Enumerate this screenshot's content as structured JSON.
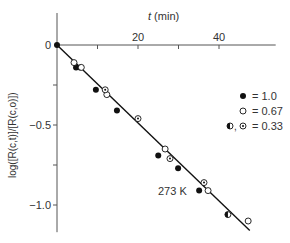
{
  "chart_data": {
    "type": "scatter",
    "title": "",
    "xlabel": "t (min)",
    "ylabel": "log([R(c,t)]/[R(c,o)])",
    "xlim": [
      0,
      54
    ],
    "ylim": [
      -1.17,
      0.2
    ],
    "x_ticks": [
      {
        "value": 0,
        "label": ""
      },
      {
        "value": 10,
        "label": ""
      },
      {
        "value": 20,
        "label": "20"
      },
      {
        "value": 30,
        "label": ""
      },
      {
        "value": 40,
        "label": "40"
      }
    ],
    "y_ticks": [
      {
        "value": 0,
        "label": "0"
      },
      {
        "value": -0.25,
        "label": ""
      },
      {
        "value": -0.5,
        "label": "-0.5"
      },
      {
        "value": -0.75,
        "label": ""
      },
      {
        "value": -1.0,
        "label": "-1.0"
      }
    ],
    "grid": false,
    "x_axis_position": "top",
    "legend_position": "right-middle",
    "annotation": "273 K",
    "fit_line": {
      "x": [
        0,
        47.6
      ],
      "y": [
        0,
        -1.16
      ]
    },
    "series": [
      {
        "name": "= 1.0",
        "marker": "filled",
        "points": [
          {
            "x": 0,
            "y": 0
          },
          {
            "x": 4.7,
            "y": -0.14
          },
          {
            "x": 5.7,
            "y": -0.14
          },
          {
            "x": 9.6,
            "y": -0.28
          },
          {
            "x": 14.8,
            "y": -0.41
          },
          {
            "x": 25.0,
            "y": -0.69
          },
          {
            "x": 29.9,
            "y": -0.77
          },
          {
            "x": 35.1,
            "y": -0.91
          }
        ]
      },
      {
        "name": "= 0.67",
        "marker": "open",
        "points": [
          {
            "x": 4.2,
            "y": -0.11
          },
          {
            "x": 6.0,
            "y": -0.14
          },
          {
            "x": 12.3,
            "y": -0.31
          },
          {
            "x": 26.7,
            "y": -0.65
          },
          {
            "x": 37.3,
            "y": -0.91
          },
          {
            "x": 47.2,
            "y": -1.1
          }
        ]
      },
      {
        "name": "= 0.33",
        "marker": "dotted-or-half",
        "points": [
          {
            "x": 11.9,
            "y": -0.28,
            "marker": "dotted"
          },
          {
            "x": 20.0,
            "y": -0.46,
            "marker": "dotted"
          },
          {
            "x": 27.9,
            "y": -0.71,
            "marker": "dotted"
          },
          {
            "x": 36.3,
            "y": -0.86,
            "marker": "dotted"
          },
          {
            "x": 42.2,
            "y": -1.06,
            "marker": "half"
          }
        ]
      }
    ]
  },
  "labels": {
    "x_axis": "t (min)",
    "y_axis": "log([R(c,t)]/[R(c,o)])",
    "annotation": "273 K",
    "legend": [
      "= 1.0",
      "= 0.67",
      "= 0.33"
    ]
  },
  "colors": {
    "axis": "#555555",
    "line": "#111111",
    "marker": "#111111",
    "text": "#333333"
  }
}
